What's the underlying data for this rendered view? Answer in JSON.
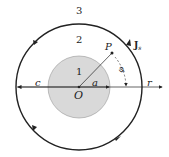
{
  "diagram": {
    "region_labels": {
      "inner": "1",
      "middle": "2",
      "outer": "3"
    },
    "center_label": "O",
    "point_label": "P",
    "radius_label": "a",
    "outer_radius_label": "c",
    "axis_label": "r",
    "angle_label": "φ",
    "current_label": "J",
    "current_subscript": "s",
    "colors": {
      "inner_fill": "#d9d9d9",
      "stroke": "#222222"
    }
  }
}
